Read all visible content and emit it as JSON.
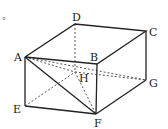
{
  "diagram": {
    "type": "rectangular prism (cuboid) with diagonals",
    "vertices": {
      "A": {
        "label": "A",
        "x": 25,
        "y": 57
      },
      "B": {
        "label": "B",
        "x": 97,
        "y": 64
      },
      "C": {
        "label": "C",
        "x": 146,
        "y": 31
      },
      "D": {
        "label": "D",
        "x": 75,
        "y": 24
      },
      "E": {
        "label": "E",
        "x": 25,
        "y": 106
      },
      "F": {
        "label": "F",
        "x": 96,
        "y": 114
      },
      "G": {
        "label": "G",
        "x": 146,
        "y": 80
      },
      "H": {
        "label": "H",
        "x": 75,
        "y": 72
      }
    },
    "solid_edges": [
      "AB",
      "BC",
      "CD",
      "DA",
      "AE",
      "EF",
      "BF",
      "FG",
      "CG",
      "AF"
    ],
    "dashed_edges": [
      "DH",
      "EH",
      "HG",
      "AH",
      "AG",
      "HF"
    ],
    "stray_mark": "°"
  }
}
